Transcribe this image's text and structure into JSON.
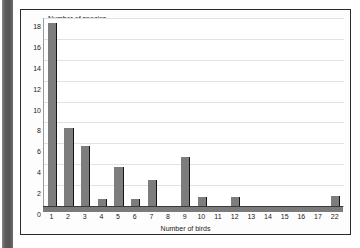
{
  "chart_data": {
    "type": "bar",
    "title": "",
    "xlabel": "Number of birds",
    "ylabel": "Number of species",
    "categories": [
      "1",
      "2",
      "3",
      "4",
      "5",
      "6",
      "7",
      "8",
      "9",
      "10",
      "11",
      "12",
      "13",
      "14",
      "15",
      "16",
      "17",
      "22"
    ],
    "values": [
      17.5,
      7.5,
      5.7,
      0.7,
      3.7,
      0.7,
      2.5,
      0,
      4.7,
      0.9,
      0,
      0.9,
      0,
      0,
      0,
      0,
      0,
      1.0
    ],
    "ylim": [
      0,
      18
    ],
    "ytick_step": 2,
    "yticks": [
      "0",
      "2",
      "4",
      "6",
      "8",
      "10",
      "12",
      "14",
      "16",
      "18"
    ],
    "grid": true,
    "legend": "none",
    "bar_color": "#7d7d7d",
    "bar_edge_color": "#141414",
    "gridline_color": "#e2e2e2",
    "axis_color": "#7b7b7b",
    "plot_background": "#ffffff",
    "frame_color": "#2b2b2b"
  }
}
